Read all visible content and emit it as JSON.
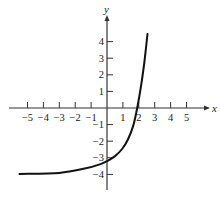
{
  "chart_data": {
    "type": "line",
    "title": "",
    "xlabel": "x",
    "ylabel": "y",
    "xlim": [
      -5.5,
      6.2
    ],
    "ylim": [
      -5,
      5
    ],
    "grid": false,
    "legend": null,
    "x_ticks": [
      -5,
      -4,
      -3,
      -2,
      -1,
      1,
      2,
      3,
      4,
      5
    ],
    "y_ticks": [
      -4,
      -3,
      -2,
      -1,
      1,
      2,
      3,
      4
    ],
    "x_tick_labels": [
      "−5",
      "−4",
      "−3",
      "−2",
      "−1",
      "1",
      "2",
      "3",
      "4",
      "5"
    ],
    "y_tick_labels": [
      "−4",
      "−3",
      "−2",
      "−1",
      "1",
      "2",
      "3",
      "4"
    ],
    "series": [
      {
        "name": "exponential curve",
        "description": "Increasing exponential with horizontal asymptote y = -4, crossing x-axis near x = 2, y-intercept near -3.45",
        "x": [
          -5.5,
          -3.0,
          -1.4,
          -0.45,
          0.0,
          0.5,
          0.95,
          1.3,
          1.65,
          1.9,
          2.15,
          2.35,
          2.55
        ],
        "y": [
          -3.97,
          -3.91,
          -3.65,
          -3.4,
          -3.2,
          -2.9,
          -2.47,
          -1.93,
          -1.08,
          0.0,
          1.39,
          2.77,
          4.46
        ]
      }
    ],
    "asymptote": {
      "y": -4
    },
    "x_intercept": 2,
    "y_intercept": -3.45
  },
  "layout": {
    "origin_px": [
      107,
      108
    ],
    "x_unit_px": 15.9,
    "y_unit_px": 16.6,
    "x_axis_px": [
      9,
      207
    ],
    "y_axis_px": [
      18,
      190
    ],
    "colors": {
      "axis": "#333333",
      "curve": "#111111",
      "text": "#1a1a1a"
    }
  }
}
